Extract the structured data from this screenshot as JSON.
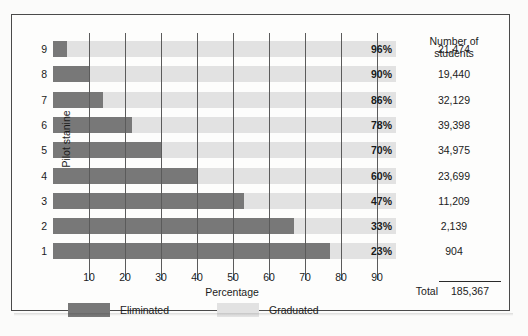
{
  "figure": {
    "y_axis_title": "Pilot stanine",
    "x_axis_title": "Percentage",
    "students_header_line1": "Number of",
    "students_header_line2": "students",
    "total_label": "Total",
    "total_value": "185,367"
  },
  "legend": {
    "eliminated_label": "Eliminated",
    "graduated_label": "Graduated",
    "eliminated_color": "#787878",
    "graduated_color": "#e2e2e2"
  },
  "xticks": [
    "10",
    "20",
    "30",
    "40",
    "50",
    "60",
    "70",
    "80",
    "90"
  ],
  "rows": [
    {
      "stanine": "9",
      "graduated_pct_label": "96%",
      "graduated_pct": 96,
      "eliminated_pct": 4,
      "students": "21,474"
    },
    {
      "stanine": "8",
      "graduated_pct_label": "90%",
      "graduated_pct": 90,
      "eliminated_pct": 10,
      "students": "19,440"
    },
    {
      "stanine": "7",
      "graduated_pct_label": "86%",
      "graduated_pct": 86,
      "eliminated_pct": 14,
      "students": "32,129"
    },
    {
      "stanine": "6",
      "graduated_pct_label": "78%",
      "graduated_pct": 78,
      "eliminated_pct": 22,
      "students": "39,398"
    },
    {
      "stanine": "5",
      "graduated_pct_label": "70%",
      "graduated_pct": 70,
      "eliminated_pct": 30,
      "students": "34,975"
    },
    {
      "stanine": "4",
      "graduated_pct_label": "60%",
      "graduated_pct": 60,
      "eliminated_pct": 40,
      "students": "23,699"
    },
    {
      "stanine": "3",
      "graduated_pct_label": "47%",
      "graduated_pct": 47,
      "eliminated_pct": 53,
      "students": "11,209"
    },
    {
      "stanine": "2",
      "graduated_pct_label": "33%",
      "graduated_pct": 33,
      "eliminated_pct": 67,
      "students": "2,139"
    },
    {
      "stanine": "1",
      "graduated_pct_label": "23%",
      "graduated_pct": 23,
      "eliminated_pct": 77,
      "students": "904"
    }
  ],
  "chart_data": {
    "type": "bar",
    "orientation": "horizontal",
    "stacked": true,
    "title": "",
    "xlabel": "Percentage",
    "ylabel": "Pilot stanine",
    "xlim": [
      0,
      95
    ],
    "xticks": [
      10,
      20,
      30,
      40,
      50,
      60,
      70,
      80,
      90
    ],
    "grid": true,
    "legend_position": "bottom",
    "categories": [
      "9",
      "8",
      "7",
      "6",
      "5",
      "4",
      "3",
      "2",
      "1"
    ],
    "series": [
      {
        "name": "Eliminated",
        "color": "#787878",
        "values": [
          4,
          10,
          14,
          22,
          30,
          40,
          53,
          67,
          77
        ]
      },
      {
        "name": "Graduated",
        "color": "#e2e2e2",
        "values": [
          96,
          90,
          86,
          78,
          70,
          60,
          47,
          33,
          23
        ]
      }
    ],
    "annotations": {
      "graduated_labels": [
        "96%",
        "90%",
        "86%",
        "78%",
        "70%",
        "60%",
        "47%",
        "33%",
        "23%"
      ],
      "number_of_students": [
        "21,474",
        "19,440",
        "32,129",
        "39,398",
        "34,975",
        "23,699",
        "11,209",
        "2,139",
        "904"
      ],
      "total_students": "185,367"
    }
  }
}
